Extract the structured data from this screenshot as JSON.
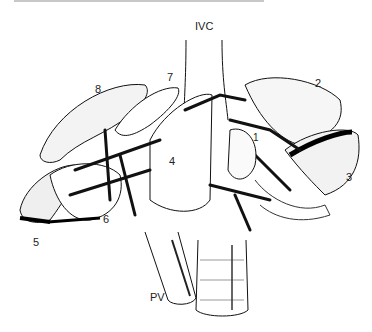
{
  "figure": {
    "type": "anatomical-illustration",
    "labels": {
      "ivc": "IVC",
      "pv": "PV",
      "seg1": "1",
      "seg2": "2",
      "seg3": "3",
      "seg4": "4",
      "seg5": "5",
      "seg6": "6",
      "seg7": "7",
      "seg8": "8"
    },
    "colors": {
      "ink": "#111111",
      "background": "#ffffff"
    }
  }
}
